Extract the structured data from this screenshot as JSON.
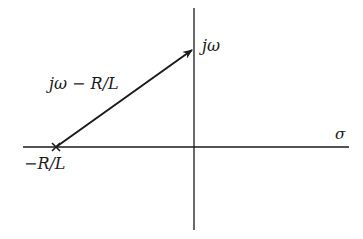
{
  "diagram": {
    "type": "s-plane vector diagram",
    "axes": {
      "horizontal_label": "σ",
      "vertical_label": "jω"
    },
    "pole": {
      "marker": "×",
      "label": "−R/L"
    },
    "vector": {
      "label": "jω − R/L",
      "from": "−R/L",
      "to": "jω"
    },
    "colors": {
      "stroke": "#1a1a1a",
      "background": "#ffffff"
    }
  }
}
